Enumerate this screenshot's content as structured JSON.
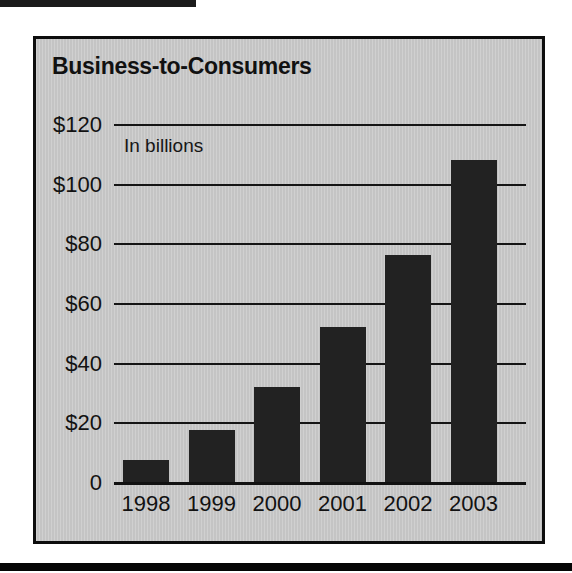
{
  "page": {
    "background_color": "#ffffff",
    "rule_color": "#0d0d0d"
  },
  "panel": {
    "background_color": "#c9c9c9",
    "border_color": "#0d0d0d"
  },
  "chart_data": {
    "type": "bar",
    "title": "Business-to-Consumers",
    "subtitle": "",
    "annotation": "In billions",
    "xlabel": "",
    "ylabel": "",
    "categories": [
      "1998",
      "1999",
      "2000",
      "2001",
      "2002",
      "2003"
    ],
    "values": [
      7.5,
      17.5,
      32,
      52,
      76,
      108
    ],
    "ylim": [
      0,
      120
    ],
    "ytick_values": [
      0,
      20,
      40,
      60,
      80,
      100,
      120
    ],
    "ytick_labels": [
      "0",
      "$20",
      "$40",
      "$60",
      "$80",
      "$100",
      "$120"
    ],
    "grid": true,
    "grid_axis": "y",
    "legend": false,
    "bar_color": "#222222",
    "series": [
      {
        "name": "Business-to-Consumers",
        "values": [
          7.5,
          17.5,
          32,
          52,
          76,
          108
        ]
      }
    ]
  }
}
